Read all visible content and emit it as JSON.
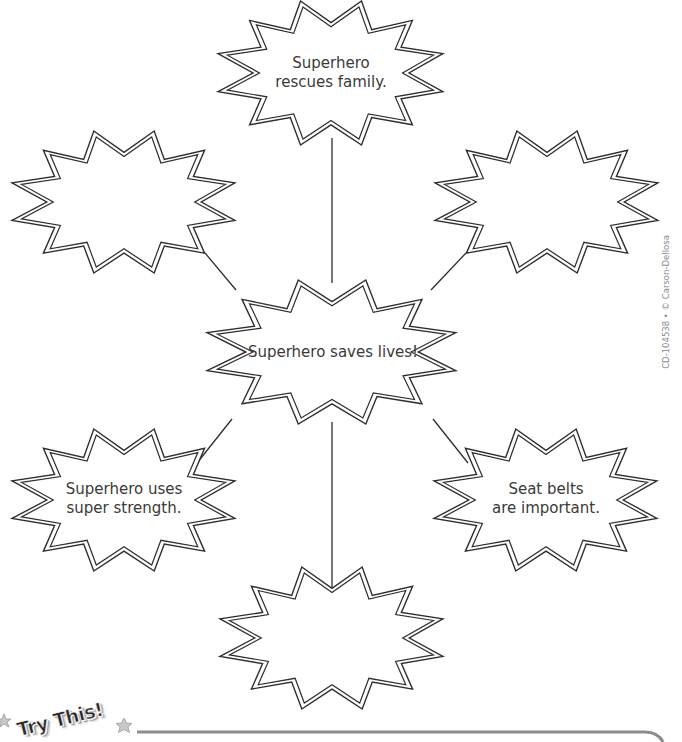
{
  "worksheet": {
    "center": {
      "label": "Superhero saves lives!",
      "cx": 332,
      "cy": 352,
      "hw": 125,
      "hh": 72
    },
    "bubbles": [
      {
        "id": "top",
        "label": "Superhero\nrescues family.",
        "cx": 331,
        "cy": 73,
        "hw": 113,
        "hh": 72
      },
      {
        "id": "upper-left",
        "label": "",
        "cx": 124,
        "cy": 202,
        "hw": 112,
        "hh": 71
      },
      {
        "id": "upper-right",
        "label": "",
        "cx": 547,
        "cy": 202,
        "hw": 112,
        "hh": 71
      },
      {
        "id": "lower-left",
        "label": "Superhero uses\nsuper strength.",
        "cx": 124,
        "cy": 500,
        "hw": 112,
        "hh": 71
      },
      {
        "id": "lower-right",
        "label": "Seat belts\nare important.",
        "cx": 546,
        "cy": 500,
        "hw": 112,
        "hh": 71
      },
      {
        "id": "bottom",
        "label": "",
        "cx": 332,
        "cy": 638,
        "hw": 112,
        "hh": 71
      }
    ],
    "connectors": [
      {
        "from": "top",
        "x1": 332,
        "y1": 138,
        "x2": 332,
        "y2": 283
      },
      {
        "from": "upper-left",
        "x1": 205,
        "y1": 253,
        "x2": 236,
        "y2": 290
      },
      {
        "from": "upper-right",
        "x1": 466,
        "y1": 253,
        "x2": 431,
        "y2": 290
      },
      {
        "from": "lower-left",
        "x1": 232,
        "y1": 419,
        "x2": 197,
        "y2": 463
      },
      {
        "from": "lower-right",
        "x1": 433,
        "y1": 419,
        "x2": 468,
        "y2": 463
      },
      {
        "from": "bottom",
        "x1": 332,
        "y1": 422,
        "x2": 332,
        "y2": 593
      }
    ],
    "stroke_color": "#2e2e2e",
    "text_color": "#3a3a3a"
  },
  "footer": {
    "try_this_label": "Try This!",
    "rule_color": "#8c8c8c"
  },
  "copyright": "CD-104538 • © Carson-Dellosa"
}
